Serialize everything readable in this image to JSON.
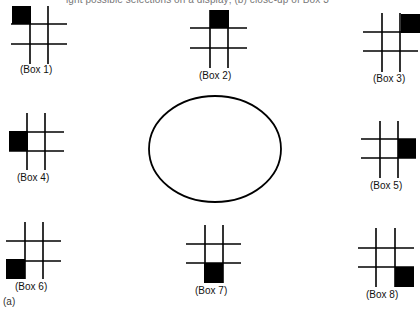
{
  "caption": "ight possible selections on a display; (b) close-up of Box 3",
  "panel_label": "(a)",
  "center_shape": "ellipse",
  "boxes": [
    {
      "label": "(Box 1)",
      "selected_cell": "top-left"
    },
    {
      "label": "(Box 2)",
      "selected_cell": "top-center"
    },
    {
      "label": "(Box 3)",
      "selected_cell": "top-right"
    },
    {
      "label": "(Box 4)",
      "selected_cell": "middle-left"
    },
    {
      "label": "(Box 5)",
      "selected_cell": "middle-right"
    },
    {
      "label": "(Box 6)",
      "selected_cell": "bottom-left"
    },
    {
      "label": "(Box 7)",
      "selected_cell": "bottom-center"
    },
    {
      "label": "(Box 8)",
      "selected_cell": "bottom-right"
    }
  ]
}
